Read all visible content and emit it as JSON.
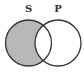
{
  "diagram": {
    "type": "venn",
    "sets": [
      {
        "label": "S",
        "cx": 28.5,
        "cy": 43,
        "r": 23
      },
      {
        "label": "P",
        "cx": 58,
        "cy": 43,
        "r": 23
      }
    ],
    "shaded_region": "S only (S minus P)",
    "colors": {
      "shade": "#b8b8b8",
      "stroke": "#333333",
      "background": "#ffffff"
    }
  }
}
